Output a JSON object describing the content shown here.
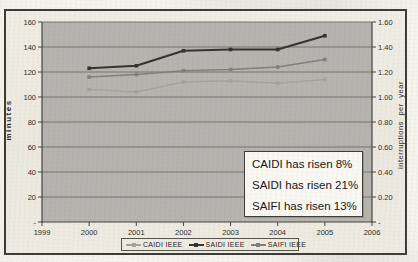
{
  "chart_data": {
    "type": "line",
    "x": [
      2000,
      2001,
      2002,
      2003,
      2004,
      2005
    ],
    "x_ticks": [
      "1999",
      "2000",
      "2001",
      "2002",
      "2003",
      "2004",
      "2005",
      "2006"
    ],
    "series": [
      {
        "name": "CAIDI IEEE",
        "axis": "left",
        "color": "#a6a39a",
        "width": 1.6,
        "values": [
          106,
          104,
          112,
          113,
          111,
          114
        ]
      },
      {
        "name": "SAIDI IEEE",
        "axis": "left",
        "color": "#34332e",
        "width": 2.2,
        "values": [
          123,
          125,
          137,
          138,
          138,
          149
        ]
      },
      {
        "name": "SAIFI IEEE",
        "axis": "right",
        "color": "#82807a",
        "width": 1.6,
        "values": [
          1.16,
          1.18,
          1.21,
          1.22,
          1.24,
          1.3
        ]
      }
    ],
    "left_axis": {
      "label": "minutes",
      "min": 0,
      "max": 160,
      "step": 20,
      "tick_labels": [
        "-",
        "20",
        "40",
        "60",
        "80",
        "100",
        "120",
        "140",
        "160"
      ]
    },
    "right_axis": {
      "label": "interruptions per year",
      "min": 0,
      "max": 1.6,
      "step": 0.2,
      "tick_labels": [
        "-",
        "0.20",
        "0.40",
        "0.60",
        "0.80",
        "1.00",
        "1.20",
        "1.40",
        "1.60"
      ]
    },
    "grid": "horizontal",
    "legend_position": "bottom",
    "plot_bg": "#b6b4ae",
    "grid_color": "#6e6d66",
    "axis_color": "#45443f",
    "tick_text_color": "#2e2d29"
  },
  "annotation": {
    "lines": [
      "CAIDI has risen 8%",
      "SAIDI has risen 21%",
      "SAIFI has risen 13%"
    ]
  }
}
